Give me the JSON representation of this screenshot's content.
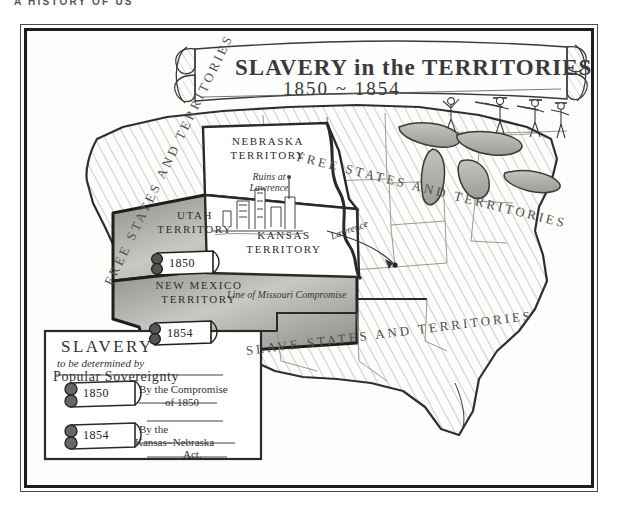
{
  "page": {
    "running_head": "A HISTORY OF US",
    "background_color": "#ffffff",
    "ink_color": "#2b2b2b"
  },
  "plate": {
    "title_line1": "SLAVERY in the TERRITORIES",
    "title_line2": "1850 ~ 1854",
    "banner_name": "title-scroll-banner",
    "vignette_caption": "border ruffians with rifles"
  },
  "map": {
    "regions": [
      {
        "name": "free-west",
        "label": "FREE STATES AND TERRITORIES",
        "shading": "diagonal-hatch-light"
      },
      {
        "name": "free-north",
        "label": "FREE STATES   AND   TERRITORIES",
        "shading": "diagonal-hatch-light"
      },
      {
        "name": "slave-south",
        "label": "SLAVE STATES AND TERRITORIES",
        "shading": "diagonal-hatch-light"
      }
    ],
    "territories": [
      {
        "name": "utah-territory",
        "line1": "UTAH",
        "line2": "TERRITORY",
        "scroll_year": "1850",
        "shading": "solid-gray"
      },
      {
        "name": "new-mexico-territory",
        "line1": "NEW MEXICO",
        "line2": "TERRITORY",
        "scroll_year": "1854",
        "shading": "solid-gray"
      },
      {
        "name": "nebraska-territory",
        "line1": "NEBRASKA",
        "line2": "TERRITORY",
        "scroll_year": "",
        "shading": "white"
      },
      {
        "name": "kansas-territory",
        "line1": "KANSAS",
        "line2": "TERRITORY",
        "scroll_year": "",
        "shading": "white"
      }
    ],
    "annotations": [
      {
        "name": "ruins-at-lawrence",
        "line1": "Ruins at",
        "line2": "Lawrence"
      },
      {
        "name": "lawrence-marker",
        "text": "Lawrence"
      },
      {
        "name": "missouri-compromise-line",
        "text": "Line of Missouri Compromise"
      }
    ]
  },
  "legend": {
    "title": "SLAVERY",
    "subtitle": "to be determined by",
    "emphasis": "Popular Sovereignty",
    "entries": [
      {
        "name": "legend-entry-1850",
        "year": "1850",
        "line1": "By the Compromise",
        "line2": "of 1850"
      },
      {
        "name": "legend-entry-1854",
        "year": "1854",
        "line1": "By the",
        "line2": "Kansas~Nebraska",
        "line3": "Act."
      }
    ]
  },
  "colors": {
    "ink": "#2b2b2b",
    "frame": "#1d1d1d",
    "hatch": "#9a9a96",
    "territory_fill": "#9e9e99",
    "paper": "#fdfdfc"
  }
}
